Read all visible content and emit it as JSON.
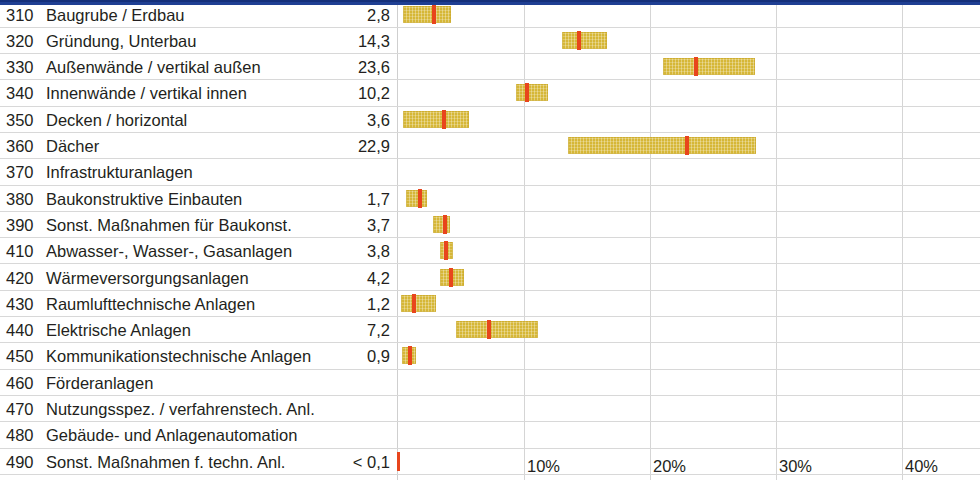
{
  "header": {
    "strip_color": "#1f3f93"
  },
  "colors": {
    "bar_fill": "#d6b737",
    "median_marker": "#e8451c",
    "gridline": "#d5d5d5",
    "row_divider": "#d8d8d8",
    "text": "#231f20"
  },
  "chart_data": {
    "type": "bar",
    "title": "",
    "xlabel": "",
    "ylabel": "",
    "xlim": [
      0,
      46
    ],
    "grid": true,
    "legend": "none",
    "xtick_labels": [
      "10%",
      "20%",
      "30%",
      "40%"
    ],
    "xtick_values": [
      10,
      20,
      30,
      40
    ],
    "categories": [
      "Baugrube / Erdbau",
      "Gründung, Unterbau",
      "Außenwände / vertikal außen",
      "Innenwände / vertikal innen",
      "Decken / horizontal",
      "Dächer",
      "Infrastrukturanlagen",
      "Baukonstruktive Einbauten",
      "Sonst. Maßnahmen für Baukonst.",
      "Abwasser-, Wasser-, Gasanlagen",
      "Wärmeversorgungsanlagen",
      "Raumlufttechnische Anlagen",
      "Elektrische Anlagen",
      "Kommunikationstechnische Anlagen",
      "Förderanlagen",
      "Nutzungsspez. / verfahrenstech. Anl.",
      "Gebäude- und Anlagenautomation",
      "Sonst. Maßnahmen f. techn. Anl."
    ],
    "values": [
      2.8,
      14.3,
      23.6,
      10.2,
      3.6,
      22.9,
      null,
      1.7,
      3.7,
      3.8,
      4.2,
      1.2,
      7.2,
      0.9,
      null,
      null,
      null,
      0.1
    ],
    "ranges": [
      [
        0.4,
        4.2
      ],
      [
        13.0,
        16.6
      ],
      [
        21.0,
        28.3
      ],
      [
        9.4,
        11.9
      ],
      [
        0.4,
        5.6
      ],
      [
        13.5,
        28.4
      ],
      null,
      [
        0.6,
        2.3
      ],
      [
        2.8,
        4.1
      ],
      [
        3.3,
        4.4
      ],
      [
        3.3,
        5.2
      ],
      [
        0.2,
        3.0
      ],
      [
        4.6,
        11.1
      ],
      [
        0.3,
        1.4
      ],
      null,
      null,
      null,
      [
        0.0,
        0.1
      ]
    ]
  },
  "rows": [
    {
      "code": "310",
      "label": "Baugrube / Erdbau",
      "value": "2,8",
      "bar": {
        "start": 0.4,
        "end": 4.2,
        "median": 2.8
      }
    },
    {
      "code": "320",
      "label": "Gründung, Unterbau",
      "value": "14,3",
      "bar": {
        "start": 13.0,
        "end": 16.6,
        "median": 14.3
      }
    },
    {
      "code": "330",
      "label": "Außenwände / vertikal außen",
      "value": "23,6",
      "bar": {
        "start": 21.0,
        "end": 28.3,
        "median": 23.6
      }
    },
    {
      "code": "340",
      "label": "Innenwände / vertikal innen",
      "value": "10,2",
      "bar": {
        "start": 9.4,
        "end": 11.9,
        "median": 10.2
      }
    },
    {
      "code": "350",
      "label": "Decken / horizontal",
      "value": "3,6",
      "bar": {
        "start": 0.4,
        "end": 5.6,
        "median": 3.6
      }
    },
    {
      "code": "360",
      "label": "Dächer",
      "value": "22,9",
      "bar": {
        "start": 13.5,
        "end": 28.4,
        "median": 22.9
      }
    },
    {
      "code": "370",
      "label": "Infrastrukturanlagen",
      "value": "",
      "bar": null
    },
    {
      "code": "380",
      "label": "Baukonstruktive Einbauten",
      "value": "1,7",
      "bar": {
        "start": 0.6,
        "end": 2.3,
        "median": 1.7
      }
    },
    {
      "code": "390",
      "label": "Sonst. Maßnahmen für Baukonst.",
      "value": "3,7",
      "bar": {
        "start": 2.8,
        "end": 4.1,
        "median": 3.7
      }
    },
    {
      "code": "410",
      "label": "Abwasser-, Wasser-, Gasanlagen",
      "value": "3,8",
      "bar": {
        "start": 3.3,
        "end": 4.4,
        "median": 3.8
      }
    },
    {
      "code": "420",
      "label": "Wärmeversorgungsanlagen",
      "value": "4,2",
      "bar": {
        "start": 3.3,
        "end": 5.2,
        "median": 4.2
      }
    },
    {
      "code": "430",
      "label": "Raumlufttechnische Anlagen",
      "value": "1,2",
      "bar": {
        "start": 0.2,
        "end": 3.0,
        "median": 1.2
      }
    },
    {
      "code": "440",
      "label": "Elektrische Anlagen",
      "value": "7,2",
      "bar": {
        "start": 4.6,
        "end": 11.1,
        "median": 7.2
      }
    },
    {
      "code": "450",
      "label": "Kommunikationstechnische Anlagen",
      "value": "0,9",
      "bar": {
        "start": 0.3,
        "end": 1.4,
        "median": 0.9
      }
    },
    {
      "code": "460",
      "label": "Förderanlagen",
      "value": "",
      "bar": null
    },
    {
      "code": "470",
      "label": "Nutzungsspez. / verfahrenstech. Anl.",
      "value": "",
      "bar": null
    },
    {
      "code": "480",
      "label": "Gebäude- und Anlagenautomation",
      "value": "",
      "bar": null
    },
    {
      "code": "490",
      "label": "Sonst. Maßnahmen f. techn. Anl.",
      "value": "< 0,1",
      "bar": {
        "start": 0.0,
        "end": 0.1,
        "median": 0.05
      }
    }
  ],
  "axis": {
    "ticks": [
      {
        "label": "10%",
        "value": 10
      },
      {
        "label": "20%",
        "value": 20
      },
      {
        "label": "30%",
        "value": 30
      },
      {
        "label": "40%",
        "value": 40
      }
    ]
  }
}
